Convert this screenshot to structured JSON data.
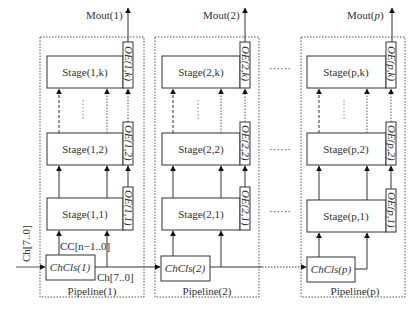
{
  "diagram": {
    "input_label": "Ch[7..0]",
    "cc_label": "CC[n−1..0]",
    "ch_out_label": "Ch[7..0]",
    "pipelines": [
      {
        "id": "1",
        "title": "Pipeline(1)",
        "mout": "Mout(1)",
        "chcls": "ChCls(1)",
        "stages": [
          {
            "label": "Stage(1,k)",
            "oe": "OE(1,k)"
          },
          {
            "label": "Stage(1,2)",
            "oe": "OE(1,2)"
          },
          {
            "label": "Stage(1,1)",
            "oe": "OE(1,1)"
          }
        ]
      },
      {
        "id": "2",
        "title": "Pipeline(2)",
        "mout": "Mout(2)",
        "chcls": "ChCls(2)",
        "stages": [
          {
            "label": "Stage(2,k)",
            "oe": "OE(2,k)"
          },
          {
            "label": "Stage(2,2)",
            "oe": "OE(2,2)"
          },
          {
            "label": "Stage(2,1)",
            "oe": "OE(2,1)"
          }
        ]
      },
      {
        "id": "p",
        "title": "Pipeline(p)",
        "mout": "Mout(p)",
        "chcls": "ChCls(p)",
        "stages": [
          {
            "label": "Stage(p,k)",
            "oe": "OE(p,k)"
          },
          {
            "label": "Stage(p,2)",
            "oe": "OE(p,2)"
          },
          {
            "label": "Stage(p,1)",
            "oe": "OE(p,1)"
          }
        ]
      }
    ],
    "ellipsis": "······"
  }
}
